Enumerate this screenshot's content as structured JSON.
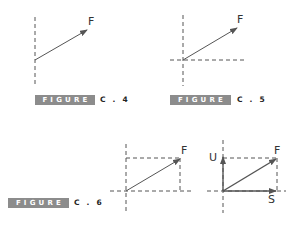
{
  "colors": {
    "line": "#555555",
    "dashed": "#555555",
    "badge_bg": "#8c8c8c",
    "badge_text": "#ffffff",
    "label": "#333333"
  },
  "figures": [
    {
      "id": "C.4",
      "badge_label": "FIGURE",
      "number_label": "C . 4",
      "vectors": [
        {
          "name": "F",
          "label": "F"
        }
      ],
      "description": "Vector F with a single vertical dashed reference line"
    },
    {
      "id": "C.5",
      "badge_label": "FIGURE",
      "number_label": "C . 5",
      "vectors": [
        {
          "name": "F",
          "label": "F"
        }
      ],
      "description": "Vector F at the origin of dashed horizontal and vertical axes"
    },
    {
      "id": "C.6",
      "badge_label": "FIGURE",
      "number_label": "C . 6",
      "vectors": [
        {
          "name": "F",
          "label": "F"
        }
      ],
      "description": "Vector F as the diagonal of a dashed rectangle on dashed axes"
    },
    {
      "id": "C.6-decomposed",
      "vectors": [
        {
          "name": "U",
          "label": "U"
        },
        {
          "name": "F",
          "label": "F"
        },
        {
          "name": "S",
          "label": "S"
        }
      ],
      "description": "Vector F decomposed into components U (vertical) and S (horizontal)"
    }
  ]
}
